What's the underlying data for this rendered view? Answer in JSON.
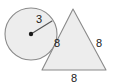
{
  "figure": {
    "background_color": "#ffffff",
    "shape_fill_color": "#ebebeb",
    "shape_stroke_color": "#8a8a8a",
    "label_color": "#202020",
    "width": 113,
    "height": 84
  },
  "circle": {
    "name": "circle",
    "center_x": 31,
    "center_y": 34,
    "radius_px": 26,
    "radius_label": "3",
    "radius_label_x": 39,
    "radius_label_y": 20,
    "radius_endpoint_x": 52,
    "radius_endpoint_y": 21,
    "center_dot_radius": 2.2
  },
  "triangle": {
    "name": "equilateral-triangle",
    "apex_x": 73,
    "apex_y": 9,
    "bottom_left_x": 42,
    "bottom_left_y": 70,
    "bottom_right_x": 106,
    "bottom_right_y": 70,
    "left_side_label": "8",
    "left_side_label_x": 57,
    "left_side_label_y": 44,
    "right_side_label": "8",
    "right_side_label_x": 99,
    "right_side_label_y": 44,
    "base_label": "8",
    "base_label_x": 74,
    "base_label_y": 79
  }
}
